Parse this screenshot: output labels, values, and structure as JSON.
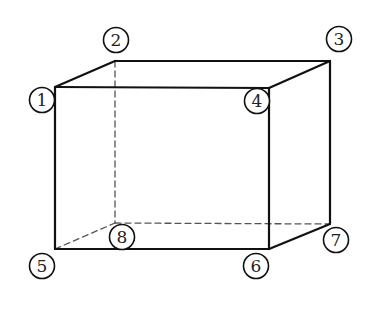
{
  "diagram": {
    "type": "rectangular-prism-vertex-labels",
    "colors": {
      "edge": "#111111",
      "hidden_edge": "#555555",
      "background": "#ffffff"
    },
    "vertices": [
      {
        "id": "1",
        "x": 55,
        "y": 87,
        "label": "1",
        "lx": 42,
        "ly": 100
      },
      {
        "id": "2",
        "x": 115,
        "y": 61,
        "label": "2",
        "lx": 116,
        "ly": 40
      },
      {
        "id": "3",
        "x": 330,
        "y": 61,
        "label": "3",
        "lx": 339,
        "ly": 39
      },
      {
        "id": "4",
        "x": 269,
        "y": 88,
        "label": "4",
        "lx": 257,
        "ly": 101
      },
      {
        "id": "5",
        "x": 55,
        "y": 249,
        "label": "5",
        "lx": 42,
        "ly": 266
      },
      {
        "id": "6",
        "x": 269,
        "y": 249,
        "label": "6",
        "lx": 256,
        "ly": 266
      },
      {
        "id": "7",
        "x": 330,
        "y": 224,
        "label": "7",
        "lx": 336,
        "ly": 240
      },
      {
        "id": "8",
        "x": 115,
        "y": 223,
        "label": "8",
        "lx": 122,
        "ly": 237
      }
    ],
    "visible_edges": [
      [
        "1",
        "2"
      ],
      [
        "2",
        "3"
      ],
      [
        "1",
        "4"
      ],
      [
        "3",
        "4"
      ],
      [
        "1",
        "5"
      ],
      [
        "4",
        "6"
      ],
      [
        "3",
        "7"
      ],
      [
        "5",
        "6"
      ],
      [
        "6",
        "7"
      ]
    ],
    "hidden_edges": [
      [
        "2",
        "8"
      ],
      [
        "5",
        "8"
      ],
      [
        "8",
        "7"
      ]
    ]
  }
}
